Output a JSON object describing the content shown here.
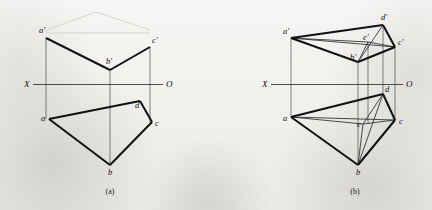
{
  "figure": {
    "width": 432,
    "height": 210,
    "background_color": "#f2f1ef",
    "ink_color": "#111111",
    "axis_color": "#3a3a3a"
  },
  "panels": [
    {
      "id": "a",
      "caption": "(a)",
      "caption_pos": {
        "x": 110,
        "y": 194
      },
      "axis": {
        "name": "X-O axis",
        "left_label": "X",
        "right_label": "O",
        "left_label_pos": {
          "x": 24,
          "y": 87
        },
        "right_label_pos": {
          "x": 166,
          "y": 87
        },
        "line": {
          "x1": 33,
          "y1": 84.5,
          "x2": 163,
          "y2": 84.5
        }
      },
      "points": [
        {
          "name": "a-prime",
          "label": "a'",
          "x": 46,
          "y": 38,
          "label_x": 39,
          "label_y": 33
        },
        {
          "name": "b-prime",
          "label": "b'",
          "x": 110,
          "y": 70,
          "label_x": 106,
          "label_y": 64
        },
        {
          "name": "c-prime",
          "label": "c'",
          "x": 150,
          "y": 47,
          "label_x": 152,
          "label_y": 43
        },
        {
          "name": "a",
          "label": "a",
          "x": 49,
          "y": 119,
          "label_x": 41,
          "label_y": 121
        },
        {
          "name": "b",
          "label": "b",
          "x": 110,
          "y": 165,
          "label_x": 108,
          "label_y": 175
        },
        {
          "name": "c",
          "label": "c",
          "x": 152,
          "y": 122,
          "label_x": 155,
          "label_y": 126
        },
        {
          "name": "d",
          "label": "d",
          "x": 140,
          "y": 101,
          "label_x": 135,
          "label_y": 108
        }
      ],
      "bold_edges": [
        {
          "name": "edge-aprime-bprime",
          "from": "a-prime",
          "to": "b-prime"
        },
        {
          "name": "edge-bprime-cprime",
          "from": "b-prime",
          "to": "c-prime"
        },
        {
          "name": "edge-a-b",
          "from": "a",
          "to": "b"
        },
        {
          "name": "edge-b-c",
          "from": "b",
          "to": "c"
        },
        {
          "name": "edge-c-d",
          "from": "c",
          "to": "d"
        },
        {
          "name": "edge-d-a",
          "from": "d",
          "to": "a"
        }
      ],
      "projection_lines": [
        {
          "name": "proj-a",
          "x1": 46,
          "y1": 38,
          "x2": 46,
          "y2": 119
        },
        {
          "name": "proj-b",
          "x1": 110,
          "y1": 70,
          "x2": 110,
          "y2": 165
        },
        {
          "name": "proj-c",
          "x1": 150,
          "y1": 47,
          "x2": 150,
          "y2": 122
        }
      ],
      "ghost_lines": [
        {
          "name": "ghost-upper-left",
          "x1": 44,
          "y1": 31,
          "x2": 96,
          "y2": 12
        },
        {
          "name": "ghost-upper-right",
          "x1": 96,
          "y1": 12,
          "x2": 150,
          "y2": 30
        },
        {
          "name": "ghost-upper-span",
          "x1": 46,
          "y1": 33,
          "x2": 150,
          "y2": 33
        }
      ]
    },
    {
      "id": "b",
      "caption": "(b)",
      "caption_pos": {
        "x": 355,
        "y": 194
      },
      "axis": {
        "name": "X-O axis",
        "left_label": "X",
        "right_label": "O",
        "left_label_pos": {
          "x": 262,
          "y": 87
        },
        "right_label_pos": {
          "x": 406,
          "y": 87
        },
        "line": {
          "x1": 271,
          "y1": 84.5,
          "x2": 403,
          "y2": 84.5
        }
      },
      "points": [
        {
          "name": "a-prime",
          "label": "a'",
          "x": 291,
          "y": 38,
          "label_x": 283,
          "label_y": 34
        },
        {
          "name": "b-prime",
          "label": "b'",
          "x": 358,
          "y": 62,
          "label_x": 350,
          "label_y": 60
        },
        {
          "name": "c-prime",
          "label": "c'",
          "x": 395,
          "y": 47,
          "label_x": 398,
          "label_y": 45
        },
        {
          "name": "d-prime",
          "label": "d'",
          "x": 383,
          "y": 25,
          "label_x": 381,
          "label_y": 20
        },
        {
          "name": "e-prime",
          "label": "e'",
          "x": 368,
          "y": 42,
          "label_x": 363,
          "label_y": 40
        },
        {
          "name": "a",
          "label": "a",
          "x": 291,
          "y": 117,
          "label_x": 283,
          "label_y": 121
        },
        {
          "name": "b",
          "label": "b",
          "x": 358,
          "y": 165,
          "label_x": 356,
          "label_y": 175
        },
        {
          "name": "c",
          "label": "c",
          "x": 395,
          "y": 120,
          "label_x": 399,
          "label_y": 124
        },
        {
          "name": "d",
          "label": "d",
          "x": 383,
          "y": 94,
          "label_x": 385,
          "label_y": 92
        },
        {
          "name": "e",
          "label": "e",
          "x": 363,
          "y": 124,
          "label_x": 357,
          "label_y": 127
        }
      ],
      "bold_edges": [
        {
          "name": "edge-aprime-dprime",
          "from": "a-prime",
          "to": "d-prime"
        },
        {
          "name": "edge-aprime-bprime",
          "from": "a-prime",
          "to": "b-prime"
        },
        {
          "name": "edge-bprime-cprime",
          "from": "b-prime",
          "to": "c-prime"
        },
        {
          "name": "edge-cprime-dprime",
          "from": "c-prime",
          "to": "d-prime"
        },
        {
          "name": "edge-a-d",
          "from": "a",
          "to": "d"
        },
        {
          "name": "edge-a-b",
          "from": "a",
          "to": "b"
        },
        {
          "name": "edge-b-c",
          "from": "b",
          "to": "c"
        },
        {
          "name": "edge-c-d",
          "from": "c",
          "to": "d"
        }
      ],
      "thin_edges": [
        {
          "name": "edge-aprime-eprime",
          "from": "a-prime",
          "to": "e-prime"
        },
        {
          "name": "edge-aprime-cprime",
          "from": "a-prime",
          "to": "c-prime"
        },
        {
          "name": "edge-bprime-eprime",
          "from": "b-prime",
          "to": "e-prime"
        },
        {
          "name": "edge-bprime-dprime",
          "from": "b-prime",
          "to": "d-prime"
        },
        {
          "name": "edge-eprime-cprime",
          "from": "e-prime",
          "to": "c-prime"
        },
        {
          "name": "edge-a-e",
          "from": "a",
          "to": "e"
        },
        {
          "name": "edge-a-c",
          "from": "a",
          "to": "c"
        },
        {
          "name": "edge-b-e",
          "from": "b",
          "to": "e"
        },
        {
          "name": "edge-b-d",
          "from": "b",
          "to": "d"
        },
        {
          "name": "edge-e-c",
          "from": "e",
          "to": "c"
        },
        {
          "name": "edge-e-d",
          "from": "e",
          "to": "d"
        }
      ],
      "projection_lines": [
        {
          "name": "proj-a",
          "x1": 291,
          "y1": 38,
          "x2": 291,
          "y2": 117
        },
        {
          "name": "proj-b",
          "x1": 358,
          "y1": 62,
          "x2": 358,
          "y2": 165
        },
        {
          "name": "proj-c",
          "x1": 395,
          "y1": 47,
          "x2": 395,
          "y2": 120
        },
        {
          "name": "proj-d",
          "x1": 383,
          "y1": 25,
          "x2": 383,
          "y2": 94
        },
        {
          "name": "proj-e",
          "x1": 368,
          "y1": 42,
          "x2": 368,
          "y2": 124
        }
      ],
      "ghost_lines": []
    }
  ]
}
